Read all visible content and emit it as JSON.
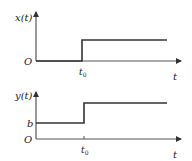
{
  "diagram": {
    "colors": {
      "axis": "#555555",
      "signal": "#333333",
      "text": "#1a1a1a",
      "background": "#ffffff"
    },
    "top_plot": {
      "ylabel": "x(t)",
      "origin_label": "O",
      "step_time_label": "t",
      "step_time_sub": "0",
      "xlabel": "t",
      "signal": {
        "before_step": "0",
        "after_step": "high"
      }
    },
    "bottom_plot": {
      "ylabel": "y(t)",
      "origin_label": "O",
      "offset_label": "b",
      "step_time_label": "t",
      "step_time_sub": "0",
      "xlabel": "t",
      "signal": {
        "before_step": "b",
        "after_step": "high"
      }
    }
  }
}
